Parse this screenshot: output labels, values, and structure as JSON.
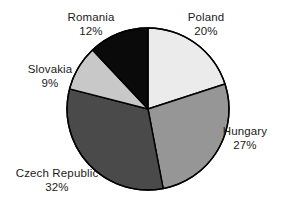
{
  "chart_data": {
    "type": "pie",
    "title": "",
    "subtitle": "",
    "xlabel": "",
    "ylabel": "",
    "legend_position": "none",
    "grid": false,
    "label_format": "name + percent",
    "start_angle_deg": 0,
    "direction": "clockwise",
    "categories": [
      "Poland",
      "Hungary",
      "Czech Republic",
      "Slovakia",
      "Romania"
    ],
    "values": [
      20,
      27,
      32,
      9,
      12
    ],
    "unit": "%",
    "total": 100,
    "slices": [
      {
        "name": "Poland",
        "value": 20,
        "value_label": "20%",
        "color": "#ebebeb",
        "start_deg": 0,
        "end_deg": 72,
        "label_x": 206,
        "label_y": 10
      },
      {
        "name": "Hungary",
        "value": 27,
        "value_label": "27%",
        "color": "#969696",
        "start_deg": 72,
        "end_deg": 169.2,
        "label_x": 245,
        "label_y": 124
      },
      {
        "name": "Czech Republic",
        "value": 32,
        "value_label": "32%",
        "color": "#4a4a4a",
        "start_deg": 169.2,
        "end_deg": 284.4,
        "label_x": 57,
        "label_y": 166
      },
      {
        "name": "Slovakia",
        "value": 9,
        "value_label": "9%",
        "color": "#c8c8c8",
        "start_deg": 284.4,
        "end_deg": 316.8,
        "label_x": 50,
        "label_y": 62
      },
      {
        "name": "Romania",
        "value": 12,
        "value_label": "12%",
        "color": "#0a0a0a",
        "start_deg": 316.8,
        "end_deg": 360,
        "label_x": 91,
        "label_y": 10
      }
    ],
    "geometry": {
      "center_x": 148,
      "center_y": 109,
      "radius": 81,
      "outline_color": "#000000",
      "outline_width": 1.4
    }
  },
  "labels": {
    "poland": {
      "name": "Poland",
      "value": "20%"
    },
    "hungary": {
      "name": "Hungary",
      "value": "27%"
    },
    "czech_republic": {
      "name": "Czech Republic",
      "value": "32%"
    },
    "slovakia": {
      "name": "Slovakia",
      "value": "9%"
    },
    "romania": {
      "name": "Romania",
      "value": "12%"
    }
  }
}
